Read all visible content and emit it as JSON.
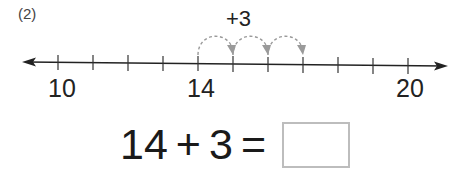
{
  "problem": {
    "number": "(2)",
    "jump_label": "+3"
  },
  "number_line": {
    "start": 10,
    "end": 20,
    "step": 1,
    "labeled_ticks": [
      {
        "value": 10,
        "label": "10",
        "x": 58
      },
      {
        "value": 14,
        "label": "14",
        "x": 198
      },
      {
        "value": 20,
        "label": "20",
        "x": 408
      }
    ],
    "jumps": [
      {
        "from": 14,
        "to": 15
      },
      {
        "from": 15,
        "to": 16
      },
      {
        "from": 16,
        "to": 17
      }
    ],
    "colors": {
      "line": "#222222",
      "jump_arcs": "#9a9a9a"
    }
  },
  "equation": {
    "operand1": "14",
    "operator": "+",
    "operand2": "3",
    "equals": "=",
    "answer": ""
  }
}
